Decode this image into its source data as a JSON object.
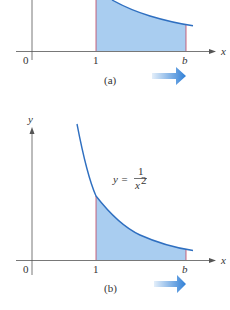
{
  "panels": [
    {
      "id": "a",
      "caption": "(a)",
      "function": "y = 1/x",
      "x_axis_label": "x",
      "tick_labels": {
        "origin": "0",
        "one": "1",
        "b": "b"
      }
    },
    {
      "id": "b",
      "caption": "(b)",
      "function_label": {
        "lhs": "y =",
        "numerator": "1",
        "denominator": "x",
        "exponent": "2"
      },
      "x_axis_label": "x",
      "y_axis_label": "y",
      "tick_labels": {
        "origin": "0",
        "one": "1",
        "b": "b"
      }
    }
  ],
  "colors": {
    "fill": "#a9cdf0",
    "curve": "#2f6fc0",
    "bound_line": "#c0405a",
    "axis": "#555555",
    "arrow_start": "#d6e8f8",
    "arrow_end": "#2f7fd6"
  }
}
